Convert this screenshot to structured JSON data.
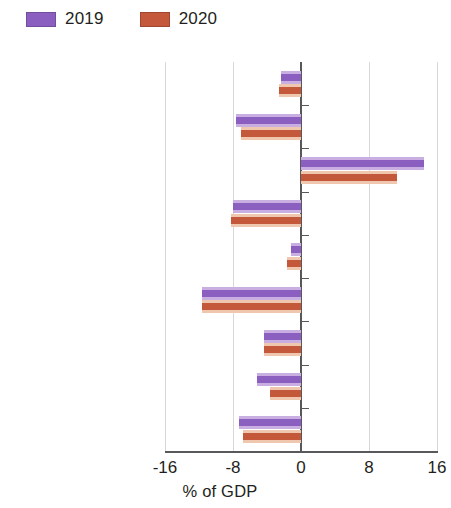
{
  "chart_data": {
    "type": "bar",
    "orientation": "horizontal",
    "title": "",
    "xlabel": "% of GDP",
    "ylabel": "",
    "xlim": [
      -16,
      16
    ],
    "xticks": [
      -16,
      -8,
      0,
      8,
      16
    ],
    "xtick_labels": [
      "-16",
      "-8",
      "0",
      "8",
      "16"
    ],
    "grid": "vertical",
    "legend_position": "top-left",
    "categories": [
      "Central Asia",
      "Armenia",
      "Azerbaijan",
      "Georgia",
      "Kazakhstan",
      "Kyrgyz Republic",
      "Tajikistan",
      "Turkmenistan",
      "Uzbekistan"
    ],
    "emphasized_categories": [
      "Central Asia"
    ],
    "series": [
      {
        "name": "2019",
        "color": "#8B5FBF",
        "halo_color": "#C9AEE2",
        "values": [
          -2.3,
          -7.6,
          14.5,
          -8.0,
          -1.2,
          -11.6,
          -4.3,
          -5.2,
          -7.3
        ]
      },
      {
        "name": "2020",
        "color": "#C4583A",
        "halo_color": "#EFC6AE",
        "values": [
          -2.6,
          -7.1,
          11.3,
          -8.2,
          -1.6,
          -11.6,
          -4.3,
          -3.6,
          -6.8
        ]
      }
    ]
  },
  "legend": {
    "entries": [
      {
        "label": "2019",
        "color": "#8B5FBF"
      },
      {
        "label": "2020",
        "color": "#C4583A"
      }
    ]
  },
  "axis": {
    "x_title": "% of GDP"
  }
}
